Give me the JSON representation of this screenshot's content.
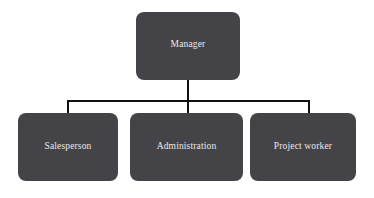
{
  "diagram": {
    "type": "organization-chart",
    "background_color": "#ffffff",
    "node_fill_color": "#444448",
    "node_text_color": "#e8e8e8",
    "connector_color": "#111111",
    "root": {
      "id": "manager",
      "label": "Manager"
    },
    "children": [
      {
        "id": "salesperson",
        "label": "Salesperson"
      },
      {
        "id": "administration",
        "label": "Administration"
      },
      {
        "id": "project-worker",
        "label": "Project worker"
      }
    ]
  }
}
